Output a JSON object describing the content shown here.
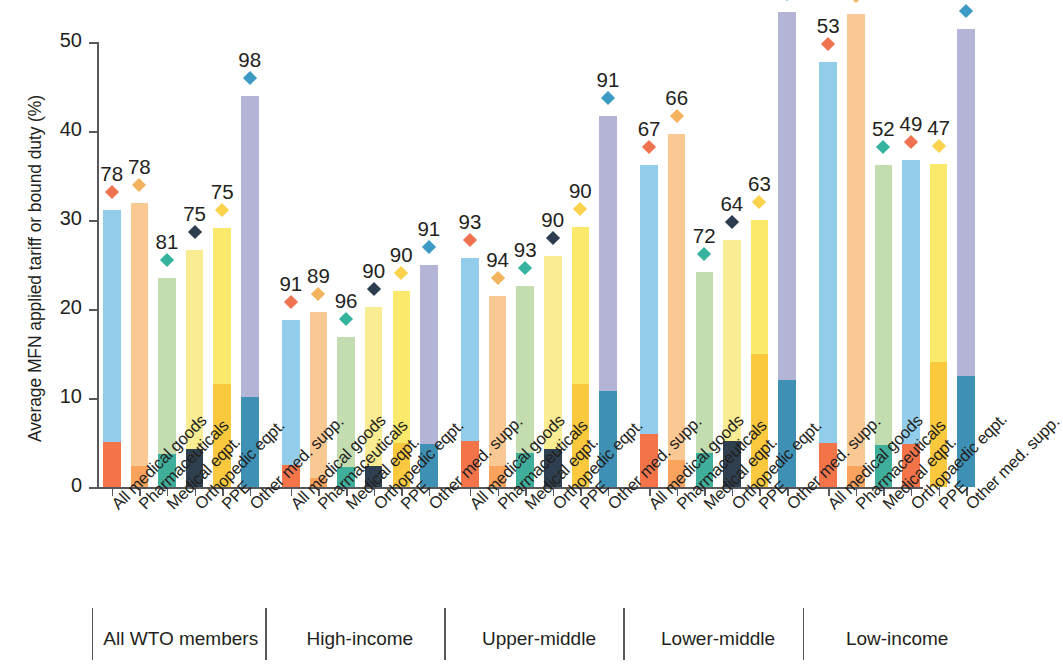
{
  "chart_data": {
    "type": "bar",
    "title": "",
    "subtitle": "",
    "xlabel": "",
    "ylabel": "Average MFN applied tariff or bound duty (%)",
    "ylim": [
      0,
      50
    ],
    "yticks": [
      0,
      10,
      20,
      30,
      40,
      50
    ],
    "ytick_labels": [
      "0",
      "10",
      "20",
      "30",
      "40",
      "50"
    ],
    "grid": false,
    "legend_position": "none",
    "note": "Stacked/overlaid bars: light segment is average bound duty (full bar height), dark segment at base is average MFN applied tariff. Diamond markers with data labels show binding coverage (%).",
    "categories": [
      "All medical goods",
      "Pharmaceuticals",
      "Medical eqpt.",
      "Orthopedic eqpt.",
      "PPE",
      "Other med. supp."
    ],
    "category_colors": [
      {
        "name": "All medical goods",
        "applied": "#F4744A",
        "bound": "#92CDEB",
        "marker": "#EF7350"
      },
      {
        "name": "Pharmaceuticals",
        "applied": "#F9A35C",
        "bound": "#FAC893",
        "marker": "#F5B25F"
      },
      {
        "name": "Medical eqpt.",
        "applied": "#3FAE9B",
        "bound": "#C4DDB0",
        "marker": "#35B39E"
      },
      {
        "name": "Orthopedic eqpt.",
        "applied": "#2E3F4F",
        "bound": "#F9EC92",
        "marker": "#2B3D4F"
      },
      {
        "name": "PPE",
        "applied": "#FBC93D",
        "bound": "#FAE96A",
        "marker": "#FAD24B"
      },
      {
        "name": "Other med. supp.",
        "applied": "#3E91B5",
        "bound": "#B4B5D6",
        "marker": "#3D9AC4"
      }
    ],
    "groups": [
      {
        "name": "All WTO members",
        "categories": [
          "All medical goods",
          "Pharmaceuticals",
          "Medical eqpt.",
          "Orthopedic eqpt.",
          "PPE",
          "Other med. supp."
        ],
        "bound": [
          31.1,
          31.9,
          23.5,
          26.6,
          29.1,
          43.9
        ],
        "applied": [
          5.1,
          2.4,
          3.7,
          4.3,
          11.6,
          10.1
        ],
        "binding_coverage": [
          78,
          78,
          81,
          75,
          75,
          98
        ]
      },
      {
        "name": "High-income",
        "categories": [
          "All medical goods",
          "Pharmaceuticals",
          "Medical eqpt.",
          "Orthopedic eqpt.",
          "PPE",
          "Other med. supp."
        ],
        "bound": [
          18.8,
          19.7,
          16.9,
          20.2,
          22.0,
          25.0
        ],
        "applied": [
          2.5,
          1.0,
          2.3,
          2.4,
          5.0,
          4.8
        ],
        "binding_coverage": [
          91,
          89,
          96,
          90,
          90,
          91
        ]
      },
      {
        "name": "Upper-middle",
        "categories": [
          "All medical goods",
          "Pharmaceuticals",
          "Medical eqpt.",
          "Orthopedic eqpt.",
          "PPE",
          "Other med. supp."
        ],
        "bound": [
          25.7,
          21.5,
          22.6,
          26.0,
          29.2,
          41.7
        ],
        "applied": [
          5.2,
          2.4,
          3.8,
          4.3,
          11.6,
          10.8
        ],
        "binding_coverage": [
          93,
          94,
          93,
          90,
          90,
          91
        ]
      },
      {
        "name": "Lower-middle",
        "categories": [
          "All medical goods",
          "Pharmaceuticals",
          "Medical eqpt.",
          "Orthopedic eqpt.",
          "PPE",
          "Other med. supp."
        ],
        "bound": [
          36.2,
          39.7,
          24.2,
          27.8,
          30.0,
          53.4
        ],
        "applied": [
          6.0,
          3.0,
          3.8,
          5.2,
          14.9,
          12.0
        ],
        "binding_coverage": [
          67,
          66,
          72,
          64,
          63,
          68
        ]
      },
      {
        "name": "Low-income",
        "categories": [
          "All medical goods",
          "Pharmaceuticals",
          "Medical eqpt.",
          "Orthopaedic eqpt.",
          "PPE",
          "Other med. supp."
        ],
        "bound": [
          47.7,
          53.2,
          36.2,
          36.7,
          36.3,
          51.5
        ],
        "applied": [
          5.0,
          2.4,
          4.7,
          4.8,
          14.1,
          12.5
        ],
        "binding_coverage": [
          53,
          55,
          52,
          49,
          47,
          54
        ]
      }
    ]
  }
}
